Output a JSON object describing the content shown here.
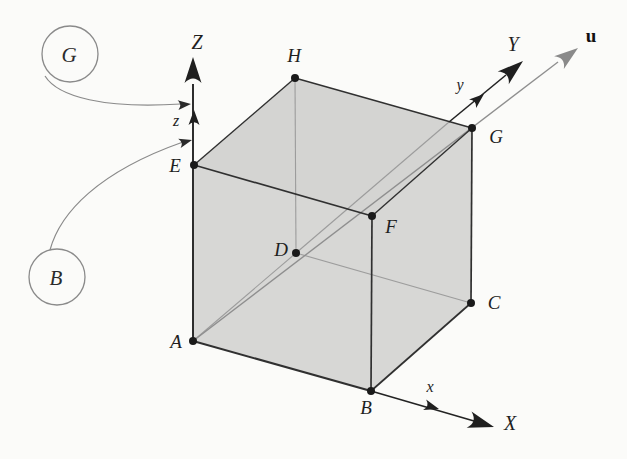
{
  "figure": {
    "vertex_labels": {
      "A": "A",
      "B": "B",
      "C": "C",
      "D": "D",
      "E": "E",
      "F": "F",
      "G": "G",
      "H": "H"
    },
    "axis_labels": {
      "X": "X",
      "Y": "Y",
      "Z": "Z"
    },
    "minor_axis_labels": {
      "x": "x",
      "y": "y",
      "z": "z"
    },
    "vector_label": "u",
    "callouts": {
      "top_circle": "G",
      "bottom_circle": "B"
    },
    "colors": {
      "background": "#fbfbf9",
      "face_fill": "#d7d7d5",
      "top_face_fill": "#d4d4d2",
      "visible_edge": "#303030",
      "hidden_edge": "#9c9c9c",
      "axis": "#232323",
      "vector_u": "#8f8f8f",
      "callout_stroke": "#8a8a8a",
      "label_text": "#1f1f1f"
    }
  }
}
